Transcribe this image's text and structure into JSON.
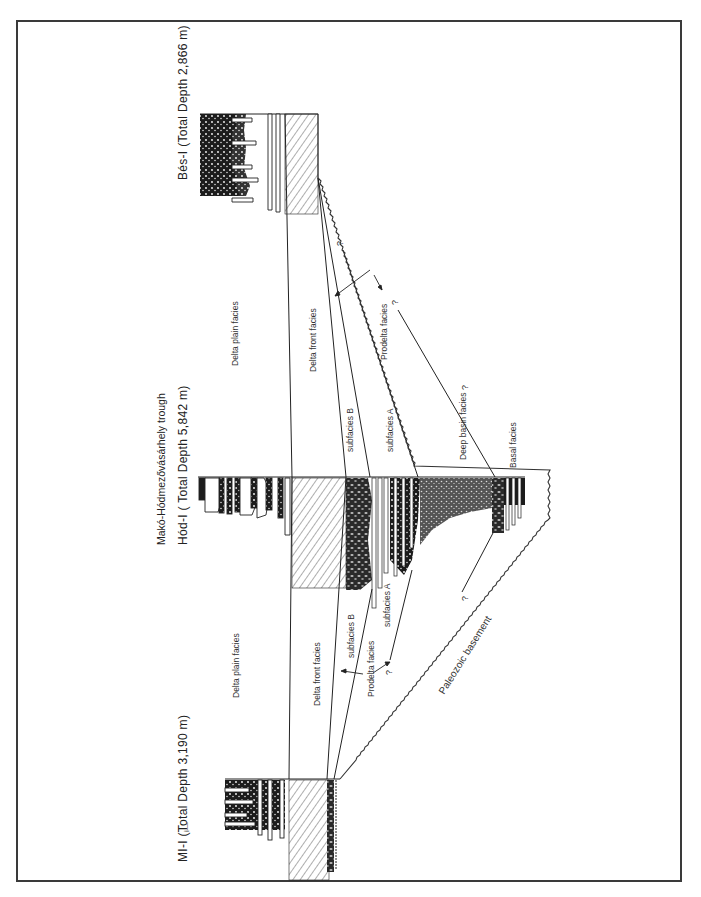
{
  "figure": {
    "orientation": "rotated 90° counter-clockwise",
    "title": "Makó-Hódmezővásárhely trough",
    "wells": [
      {
        "id": "mi1",
        "label": "MI-I (Total Depth 3,190 m)"
      },
      {
        "id": "hod1",
        "label": "Hód-I ( Total Depth 5,842 m)"
      },
      {
        "id": "bes1",
        "label": "Bés-I (Total Depth  2,866 m)"
      }
    ],
    "facies_labels": {
      "delta_plain_left": "Delta plain facies",
      "delta_plain_right": "Delta plain facies",
      "delta_front_left": "Delta front facies",
      "delta_front_right": "Delta front facies",
      "subfacies_b_left": "subfacies B",
      "subfacies_a_left": "subfacies A",
      "prodelta_left": "Prodelta facies",
      "subfacies_b_right": "subfacies B",
      "subfacies_a_right": "subfacies A",
      "prodelta_right": "Prodelta facies",
      "deep_basin": "Deep basin facies",
      "basal": "Basal facies",
      "basement": "Paleozoic basement"
    },
    "uncertainty_mark": "?",
    "margin_mark": "i—"
  }
}
